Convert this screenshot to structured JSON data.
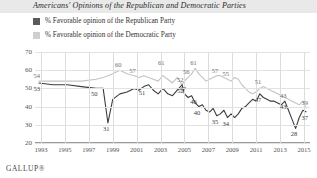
{
  "title": "Americans' Opinions of the Republican and Democratic Parties",
  "footer": "GALLUP®",
  "legend": [
    {
      "label": "% Favorable opinion of the Republican Party",
      "color": "#5a5a5a",
      "key": "republican"
    },
    {
      "label": "% Favorable opinion of the Democratic Party",
      "color": "#cfcfcf",
      "key": "democratic"
    }
  ],
  "axis": {
    "y_ticks": [
      "70",
      "60",
      "50",
      "40",
      "30",
      "20"
    ],
    "x_ticks": [
      "1993",
      "1995",
      "1997",
      "1999",
      "2001",
      "2003",
      "2005",
      "2007",
      "2009",
      "2011",
      "2013",
      "2015"
    ]
  },
  "chart_data": {
    "type": "line",
    "title": "Americans' Opinions of the Republican and Democratic Parties",
    "xlabel": "",
    "ylabel": "",
    "ylim": [
      20,
      70
    ],
    "xlim": [
      1992.5,
      2015.5
    ],
    "grid": true,
    "legend_position": "top-left",
    "x": [
      1992.8,
      1994.0,
      1995.2,
      1996.4,
      1997.6,
      1998.2,
      1998.6,
      1999.0,
      1999.6,
      2000.2,
      2000.8,
      2001.2,
      2001.6,
      2002.0,
      2002.4,
      2002.8,
      2003.2,
      2003.6,
      2004.0,
      2004.4,
      2004.8,
      2005.0,
      2005.3,
      2005.6,
      2005.9,
      2006.2,
      2006.5,
      2006.8,
      2007.1,
      2007.4,
      2007.7,
      2008.0,
      2008.3,
      2008.6,
      2008.9,
      2009.2,
      2009.5,
      2009.8,
      2010.1,
      2010.4,
      2010.7,
      2011.0,
      2011.3,
      2011.6,
      2011.9,
      2012.2,
      2012.5,
      2012.8,
      2013.1,
      2013.4,
      2013.7,
      2014.0,
      2014.3,
      2014.6,
      2014.9,
      2015.2
    ],
    "series": [
      {
        "name": "% Favorable opinion of the Republican Party",
        "color": "#3d3d3d",
        "values": [
          53,
          52,
          52,
          51,
          50,
          50,
          31,
          44,
          47,
          48,
          50,
          49,
          51,
          52,
          49,
          47,
          50,
          47,
          46,
          49,
          52,
          47,
          45,
          46,
          42,
          40,
          41,
          38,
          37,
          39,
          35,
          36,
          38,
          34,
          36,
          34,
          36,
          39,
          40,
          42,
          44,
          43,
          47,
          45,
          44,
          43,
          43,
          42,
          41,
          43,
          38,
          33,
          28,
          34,
          38,
          37
        ],
        "labeled_points": [
          {
            "x": 1992.8,
            "y": 53,
            "label": "53"
          },
          {
            "x": 1997.6,
            "y": 50,
            "label": "50"
          },
          {
            "x": 1998.6,
            "y": 31,
            "label": "31"
          },
          {
            "x": 2001.6,
            "y": 51,
            "label": "51"
          },
          {
            "x": 2004.8,
            "y": 52,
            "label": "52"
          },
          {
            "x": 2005.9,
            "y": 46,
            "label": "46"
          },
          {
            "x": 2006.2,
            "y": 40,
            "label": "40"
          },
          {
            "x": 2007.7,
            "y": 35,
            "label": "35"
          },
          {
            "x": 2008.6,
            "y": 34,
            "label": "34"
          },
          {
            "x": 2011.3,
            "y": 47,
            "label": "47"
          },
          {
            "x": 2013.4,
            "y": 43,
            "label": "43"
          },
          {
            "x": 2014.3,
            "y": 28,
            "label": "28"
          },
          {
            "x": 2015.2,
            "y": 37,
            "label": "37"
          }
        ]
      },
      {
        "name": "% Favorable opinion of the Democratic Party",
        "color": "#c3c3c3",
        "values": [
          54,
          54,
          54,
          54,
          55,
          56,
          57,
          58,
          60,
          58,
          57,
          56,
          57,
          56,
          55,
          54,
          57,
          55,
          53,
          56,
          52,
          54,
          56,
          58,
          61,
          58,
          56,
          54,
          55,
          56,
          57,
          57,
          56,
          55,
          54,
          56,
          55,
          52,
          50,
          48,
          47,
          48,
          50,
          51,
          50,
          49,
          48,
          47,
          46,
          45,
          44,
          43,
          42,
          41,
          43,
          39
        ],
        "labeled_points": [
          {
            "x": 1992.8,
            "y": 54,
            "label": "54"
          },
          {
            "x": 1999.6,
            "y": 60,
            "label": "60"
          },
          {
            "x": 2000.8,
            "y": 57,
            "label": "57"
          },
          {
            "x": 2003.2,
            "y": 61,
            "label": "61"
          },
          {
            "x": 2005.3,
            "y": 56,
            "label": "56"
          },
          {
            "x": 2005.9,
            "y": 61,
            "label": "61"
          },
          {
            "x": 2004.8,
            "y": 52,
            "label": "52"
          },
          {
            "x": 2005.0,
            "y": 47,
            "label": "47"
          },
          {
            "x": 2007.7,
            "y": 57,
            "label": "57"
          },
          {
            "x": 2008.6,
            "y": 55,
            "label": "55"
          },
          {
            "x": 2011.3,
            "y": 51,
            "label": "51"
          },
          {
            "x": 2013.4,
            "y": 43,
            "label": "43"
          },
          {
            "x": 2015.2,
            "y": 39,
            "label": "39"
          }
        ]
      }
    ]
  }
}
